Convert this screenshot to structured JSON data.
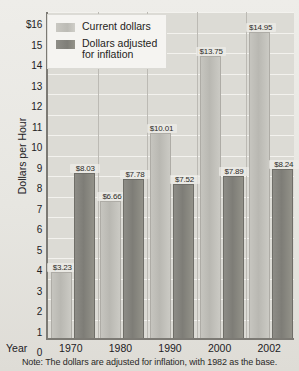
{
  "chart_data": {
    "type": "bar",
    "title": "",
    "xlabel": "Year",
    "ylabel": "Dollars per Hour",
    "categories": [
      "1970",
      "1980",
      "1990",
      "2000",
      "2002"
    ],
    "series": [
      {
        "name": "Current dollars",
        "values": [
          3.23,
          6.66,
          10.01,
          13.75,
          14.95
        ],
        "labels": [
          "$3.23",
          "$6.66",
          "$10.01",
          "$13.75",
          "$14.95"
        ],
        "color": "#bfbeb8"
      },
      {
        "name": "Dollars adjusted for inflation",
        "values": [
          8.03,
          7.78,
          7.52,
          7.89,
          8.24
        ],
        "labels": [
          "$8.03",
          "$7.78",
          "$7.52",
          "$7.89",
          "$8.24"
        ],
        "color": "#84837d"
      }
    ],
    "ylim": [
      0,
      16
    ],
    "ytick_values": [
      0,
      1,
      2,
      3,
      4,
      5,
      6,
      7,
      8,
      9,
      10,
      11,
      12,
      13,
      14,
      15,
      16
    ],
    "ytick_labels": [
      "0",
      "1",
      "2",
      "3",
      "4",
      "5",
      "6",
      "7",
      "8",
      "9",
      "10",
      "11",
      "12",
      "13",
      "14",
      "15",
      "$16"
    ],
    "grid": true,
    "legend_position": "top-left",
    "note": "Note:  The dollars are adjusted for inflation, with 1982 as the base."
  },
  "legend": {
    "items": [
      {
        "label": "Current dollars"
      },
      {
        "label": "Dollars adjusted\nfor inflation"
      }
    ]
  },
  "axes": {
    "x_title": "Year",
    "y_title": "Dollars per Hour"
  },
  "note": {
    "text": "Note:  The dollars are adjusted for inflation, with 1982 as the base."
  }
}
